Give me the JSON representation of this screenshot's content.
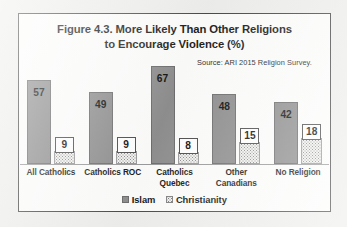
{
  "chart_data": {
    "type": "bar",
    "title": "Figure 4.3. More Likely Than Other Religions to Encourage Violence (%)",
    "title_line1": "Figure 4.3. More Likely Than Other Religions",
    "title_line2": "to Encourage Violence (%)",
    "source": "Source:  ARI 2015 Religion Survey.",
    "categories": [
      "All Catholics",
      "Catholics ROC",
      "Catholics Quebec",
      "Other Canadians",
      "No Religion"
    ],
    "category_lines": [
      [
        "All Catholics"
      ],
      [
        "Catholics ROC"
      ],
      [
        "Catholics",
        "Quebec"
      ],
      [
        "Other",
        "Canadians"
      ],
      [
        "No Religion"
      ]
    ],
    "series": [
      {
        "name": "Islam",
        "values": [
          57,
          49,
          67,
          48,
          42
        ],
        "color": "#8f8f8f"
      },
      {
        "name": "Christianity",
        "values": [
          9,
          9,
          8,
          15,
          18
        ],
        "color": "#f2f2f0"
      }
    ],
    "xlabel": "",
    "ylabel": "",
    "ylim": [
      0,
      75
    ],
    "grid": false,
    "legend_position": "bottom",
    "value_labels": true
  },
  "legend": {
    "items": [
      {
        "label": "Islam"
      },
      {
        "label": "Christianity"
      }
    ]
  }
}
